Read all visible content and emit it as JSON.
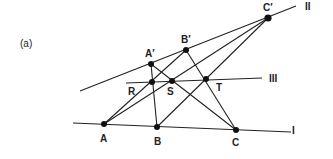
{
  "figure": {
    "panel_label": "(a)",
    "line_labels": {
      "I": "I",
      "II": "II",
      "III": "III"
    },
    "points": {
      "A": {
        "label": "A",
        "x": 104,
        "y": 124
      },
      "B": {
        "label": "B",
        "x": 157,
        "y": 127
      },
      "C": {
        "label": "C",
        "x": 236,
        "y": 130
      },
      "A_prime": {
        "label": "A′",
        "x": 151,
        "y": 64
      },
      "B_prime": {
        "label": "B′",
        "x": 186,
        "y": 50
      },
      "C_prime": {
        "label": "C′",
        "x": 268,
        "y": 18
      },
      "R": {
        "label": "R",
        "x": 152,
        "y": 82
      },
      "S": {
        "label": "S",
        "x": 172,
        "y": 81
      },
      "T": {
        "label": "T",
        "x": 206,
        "y": 79
      }
    },
    "stroke_color": "#222222"
  }
}
